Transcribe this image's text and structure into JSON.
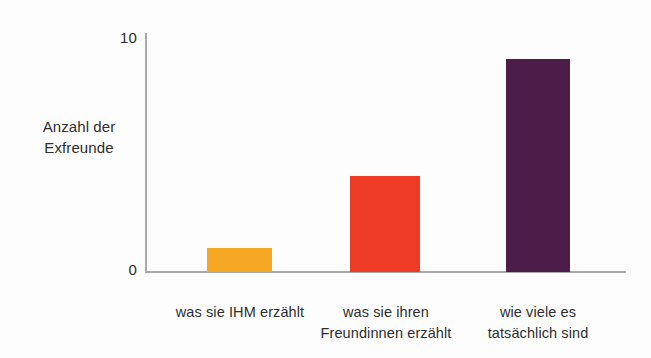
{
  "chart_data": {
    "type": "bar",
    "title": "",
    "subtitle": "",
    "xlabel": "",
    "ylabel": "Anzahl der Exfreunde",
    "ylabel_lines": [
      "Anzahl der",
      "Exfreunde"
    ],
    "categories": [
      "was sie IHM erzählt",
      "was sie ihren Freundinnen erzählt",
      "wie viele es tatsächlich sind"
    ],
    "category_lines": [
      [
        "was sie IHM erzählt"
      ],
      [
        "was sie ihren",
        "Freundinnen erzählt"
      ],
      [
        "wie viele es",
        "tatsächlich sind"
      ]
    ],
    "values": [
      1,
      4,
      8.9
    ],
    "ylim": [
      0,
      10
    ],
    "ytick_labels": [
      "0",
      "10"
    ],
    "ytick_values": [
      0,
      10
    ],
    "grid": false,
    "legend": false,
    "legend_position": "none",
    "bar_colors": [
      "#f5a623",
      "#ee3b26",
      "#4b1d48"
    ],
    "axis_color": "#a9a9a9",
    "background": "#fdfdfd",
    "text_color": "#2e2e2e"
  },
  "axis": {
    "y_tick_top": "10",
    "y_tick_bottom": "0",
    "y_title_line1": "Anzahl der",
    "y_title_line2": "Exfreunde"
  },
  "categories": {
    "cat0_line1": "was sie IHM erzählt",
    "cat1_line1": "was sie ihren",
    "cat1_line2": "Freundinnen erzählt",
    "cat2_line1": "wie viele es",
    "cat2_line2": "tatsächlich sind"
  }
}
